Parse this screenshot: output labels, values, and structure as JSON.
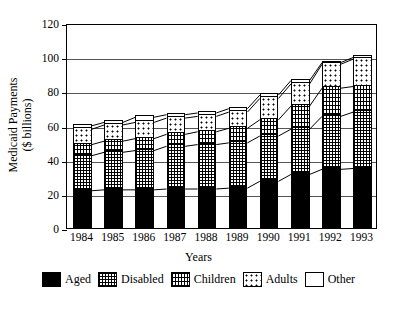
{
  "chart_data": {
    "type": "bar",
    "subtype": "stacked-bar",
    "title": "",
    "xlabel": "Years",
    "ylabel": "Medicaid Payments ($ billions)",
    "ylabel_line1": "Medicaid Payments",
    "ylabel_line2": "($ billions)",
    "ylim": [
      0,
      120
    ],
    "yticks": [
      0,
      20,
      40,
      60,
      80,
      100,
      120
    ],
    "ytick_labels": [
      "0",
      "20",
      "40",
      "60",
      "80",
      "100",
      "120"
    ],
    "grid": true,
    "grid_axis": "y",
    "legend_position": "bottom-outside",
    "categories": [
      "1984",
      "1985",
      "1986",
      "1987",
      "1988",
      "1989",
      "1990",
      "1991",
      "1992",
      "1993"
    ],
    "series": [
      {
        "name": "Aged",
        "pattern": "solid-black",
        "color": "#000000",
        "values": [
          23,
          23.5,
          23.5,
          24,
          24,
          24.5,
          28.5,
          32.5,
          35.5,
          36
        ]
      },
      {
        "name": "Disabled",
        "pattern": "dense-crosshatch",
        "color": "#000000",
        "values": [
          20.5,
          22,
          23,
          25,
          26,
          26.5,
          26.5,
          26.5,
          31,
          33
        ]
      },
      {
        "name": "Children",
        "pattern": "fine-vertical-dots",
        "color": "#000000",
        "values": [
          6.5,
          6.5,
          7,
          7,
          7.5,
          8.5,
          9.5,
          13.5,
          16.5,
          15
        ]
      },
      {
        "name": "Adults",
        "pattern": "sparse-dots",
        "color": "#000000",
        "values": [
          9,
          9.5,
          9.5,
          9.5,
          9,
          9.5,
          12.5,
          13,
          14,
          16
        ]
      },
      {
        "name": "Other",
        "pattern": "white-empty",
        "color": "#ffffff",
        "values": [
          2,
          1.5,
          3,
          2,
          2,
          2,
          2,
          2,
          1,
          1
        ]
      }
    ],
    "cumulative_tops": {
      "1984": [
        23,
        43.5,
        50,
        59,
        61
      ],
      "1985": [
        23.5,
        45.5,
        52,
        61.5,
        63
      ],
      "1986": [
        23.5,
        46.5,
        53.5,
        63,
        66
      ],
      "1987": [
        24,
        49,
        56,
        65.5,
        67.5
      ],
      "1988": [
        24,
        50,
        57.5,
        66.5,
        68.5
      ],
      "1989": [
        24.5,
        51,
        59.5,
        69,
        71
      ],
      "1990": [
        28.5,
        55,
        64.5,
        77,
        79
      ],
      "1991": [
        32.5,
        59,
        72.5,
        85.5,
        87.5
      ],
      "1992": [
        35.5,
        66.5,
        83,
        97,
        98
      ],
      "1993": [
        36,
        69,
        84,
        100,
        101
      ]
    },
    "totals": [
      61,
      63,
      66,
      67.5,
      68.5,
      71,
      79,
      87.5,
      98,
      101
    ]
  },
  "legend": {
    "items": [
      {
        "label": "Aged",
        "swatch": "swatch-aged-icon"
      },
      {
        "label": "Disabled",
        "swatch": "swatch-disabled-icon"
      },
      {
        "label": "Children",
        "swatch": "swatch-children-icon"
      },
      {
        "label": "Adults",
        "swatch": "swatch-adults-icon"
      },
      {
        "label": "Other",
        "swatch": "swatch-other-icon"
      }
    ]
  }
}
